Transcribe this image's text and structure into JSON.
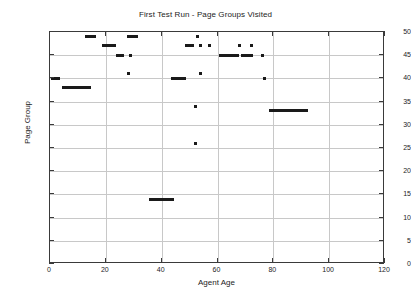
{
  "chart_data": {
    "type": "scatter",
    "title": "First Test Run - Page Groups Visited",
    "xlabel": "Agent Age",
    "ylabel": "Page Group",
    "xlim": [
      0,
      120
    ],
    "ylim": [
      0,
      50
    ],
    "xticks": [
      0,
      20,
      40,
      60,
      80,
      100,
      120
    ],
    "yticks": [
      0,
      5,
      10,
      15,
      20,
      25,
      30,
      35,
      40,
      45,
      50
    ],
    "grid": true,
    "legend": "none",
    "marker": "square",
    "marker_color": "#1a1a1a",
    "series": [
      {
        "name": "Page Groups Visited",
        "points": [
          [
            0,
            0
          ],
          [
            1,
            0
          ],
          [
            1,
            40
          ],
          [
            2,
            40
          ],
          [
            3,
            40
          ],
          [
            5,
            38
          ],
          [
            6,
            38
          ],
          [
            7,
            38
          ],
          [
            8,
            38
          ],
          [
            9,
            38
          ],
          [
            10,
            38
          ],
          [
            11,
            38
          ],
          [
            12,
            38
          ],
          [
            13,
            38
          ],
          [
            14,
            38
          ],
          [
            13,
            49
          ],
          [
            14,
            49
          ],
          [
            15,
            49
          ],
          [
            16,
            49
          ],
          [
            19,
            47
          ],
          [
            20,
            47
          ],
          [
            21,
            47
          ],
          [
            22,
            47
          ],
          [
            23,
            47
          ],
          [
            24,
            45
          ],
          [
            25,
            45
          ],
          [
            26,
            45
          ],
          [
            28,
            49
          ],
          [
            29,
            49
          ],
          [
            30,
            49
          ],
          [
            31,
            49
          ],
          [
            28,
            41
          ],
          [
            29,
            45
          ],
          [
            36,
            14
          ],
          [
            37,
            14
          ],
          [
            38,
            14
          ],
          [
            39,
            14
          ],
          [
            40,
            14
          ],
          [
            41,
            14
          ],
          [
            42,
            14
          ],
          [
            43,
            14
          ],
          [
            44,
            14
          ],
          [
            44,
            40
          ],
          [
            45,
            40
          ],
          [
            46,
            40
          ],
          [
            47,
            40
          ],
          [
            48,
            40
          ],
          [
            49,
            47
          ],
          [
            50,
            47
          ],
          [
            51,
            47
          ],
          [
            52,
            34
          ],
          [
            52,
            26
          ],
          [
            53,
            49
          ],
          [
            54,
            41
          ],
          [
            54,
            47
          ],
          [
            57,
            0
          ],
          [
            58,
            0
          ],
          [
            59,
            0
          ],
          [
            57,
            47
          ],
          [
            60,
            0
          ],
          [
            61,
            45
          ],
          [
            62,
            45
          ],
          [
            63,
            45
          ],
          [
            64,
            45
          ],
          [
            65,
            45
          ],
          [
            66,
            45
          ],
          [
            67,
            45
          ],
          [
            68,
            47
          ],
          [
            69,
            45
          ],
          [
            70,
            45
          ],
          [
            71,
            45
          ],
          [
            72,
            45
          ],
          [
            72,
            47
          ],
          [
            76,
            45
          ],
          [
            77,
            0
          ],
          [
            77,
            40
          ],
          [
            79,
            33
          ],
          [
            80,
            33
          ],
          [
            81,
            33
          ],
          [
            82,
            33
          ],
          [
            83,
            33
          ],
          [
            84,
            33
          ],
          [
            85,
            33
          ],
          [
            86,
            33
          ],
          [
            87,
            33
          ],
          [
            88,
            33
          ],
          [
            89,
            33
          ],
          [
            90,
            33
          ],
          [
            91,
            33
          ],
          [
            92,
            33
          ]
        ]
      }
    ]
  }
}
